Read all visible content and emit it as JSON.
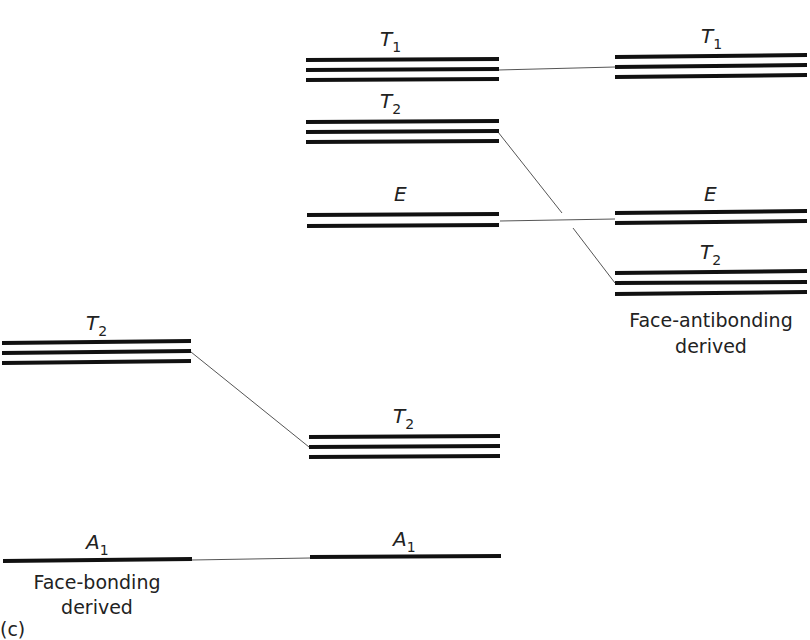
{
  "figure": {
    "panel_label": "(c)",
    "columns": {
      "left": {
        "caption_line1": "Face-bonding",
        "caption_line2": "derived"
      },
      "middle": {},
      "right": {
        "caption_line1": "Face-antibonding",
        "caption_line2": "derived"
      }
    },
    "levels": [
      {
        "id": "mid-T1",
        "column": "middle",
        "symbol": "T",
        "subscript": "1",
        "degeneracy": 3
      },
      {
        "id": "mid-T2-upper",
        "column": "middle",
        "symbol": "T",
        "subscript": "2",
        "degeneracy": 3
      },
      {
        "id": "mid-E",
        "column": "middle",
        "symbol": "E",
        "subscript": "",
        "degeneracy": 2
      },
      {
        "id": "mid-T2-lower",
        "column": "middle",
        "symbol": "T",
        "subscript": "2",
        "degeneracy": 3
      },
      {
        "id": "mid-A1",
        "column": "middle",
        "symbol": "A",
        "subscript": "1",
        "degeneracy": 1
      },
      {
        "id": "right-T1",
        "column": "right",
        "symbol": "T",
        "subscript": "1",
        "degeneracy": 3
      },
      {
        "id": "right-E",
        "column": "right",
        "symbol": "E",
        "subscript": "",
        "degeneracy": 2
      },
      {
        "id": "right-T2",
        "column": "right",
        "symbol": "T",
        "subscript": "2",
        "degeneracy": 3
      },
      {
        "id": "left-T2",
        "column": "left",
        "symbol": "T",
        "subscript": "2",
        "degeneracy": 3
      },
      {
        "id": "left-A1",
        "column": "left",
        "symbol": "A",
        "subscript": "1",
        "degeneracy": 1
      }
    ],
    "correlations": [
      {
        "from": "mid-T1",
        "to": "right-T1"
      },
      {
        "from": "mid-T2-upper",
        "to": "right-T2"
      },
      {
        "from": "mid-E",
        "to": "right-E"
      },
      {
        "from": "left-T2",
        "to": "mid-T2-lower"
      },
      {
        "from": "left-A1",
        "to": "mid-A1"
      }
    ],
    "labels": {
      "mid_T1": {
        "main": "T",
        "sub": "1"
      },
      "mid_T2_upper": {
        "main": "T",
        "sub": "2"
      },
      "mid_E": {
        "main": "E"
      },
      "mid_T2_lower": {
        "main": "T",
        "sub": "2"
      },
      "mid_A1": {
        "main": "A",
        "sub": "1"
      },
      "right_T1": {
        "main": "T",
        "sub": "1"
      },
      "right_E": {
        "main": "E"
      },
      "right_T2": {
        "main": "T",
        "sub": "2"
      },
      "left_T2": {
        "main": "T",
        "sub": "2"
      },
      "left_A1": {
        "main": "A",
        "sub": "1"
      }
    },
    "colors": {
      "level_line": "#111111",
      "connector": "#555555",
      "text": "#222222"
    }
  }
}
